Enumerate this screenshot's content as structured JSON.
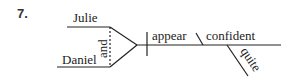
{
  "exercise": {
    "number": "7."
  },
  "diagram": {
    "type": "sentence-diagram",
    "compound_subject": {
      "subjects": [
        "Julie",
        "Daniel"
      ],
      "conjunction": "and"
    },
    "verb": "appear",
    "subject_complement": "confident",
    "modifier": "quite"
  }
}
